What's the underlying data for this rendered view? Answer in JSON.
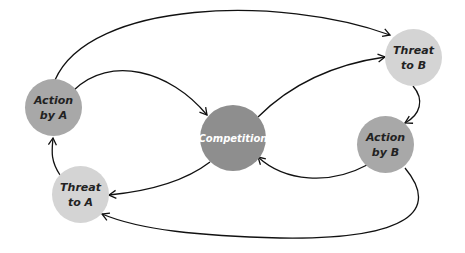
{
  "diagram": {
    "nodes": [
      {
        "id": "action_a",
        "line1": "Action",
        "line2": "by A",
        "color": "#a8a8a8"
      },
      {
        "id": "threat_b",
        "line1": "Threat",
        "line2": "to B",
        "color": "#d4d4d4"
      },
      {
        "id": "competition",
        "line1": "Competition",
        "line2": "",
        "color": "#8e8e8e"
      },
      {
        "id": "action_b",
        "line1": "Action",
        "line2": "by B",
        "color": "#a8a8a8"
      },
      {
        "id": "threat_a",
        "line1": "Threat",
        "line2": "to A",
        "color": "#d4d4d4"
      }
    ],
    "edges": [
      {
        "from": "Action by A",
        "to": "Threat to B"
      },
      {
        "from": "Action by A",
        "to": "Competition"
      },
      {
        "from": "Competition",
        "to": "Threat to B"
      },
      {
        "from": "Threat to B",
        "to": "Action by B"
      },
      {
        "from": "Action by B",
        "to": "Competition"
      },
      {
        "from": "Competition",
        "to": "Threat to A"
      },
      {
        "from": "Action by B",
        "to": "Threat to A"
      },
      {
        "from": "Threat to A",
        "to": "Action by A"
      }
    ]
  }
}
